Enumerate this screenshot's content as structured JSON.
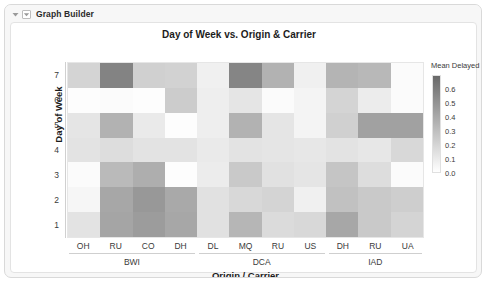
{
  "window": {
    "titlebar_label": "Graph Builder",
    "outer_disclosure_icon": "triangle-down-icon",
    "inner_disclosure_icon": "triangle-down-boxed-icon"
  },
  "chart_data": {
    "type": "heatmap",
    "title": "Day of Week vs. Origin & Carrier",
    "xlabel": "Origin / Carrier",
    "ylabel": "Day of Week",
    "legend_title": "Mean Delayed",
    "legend_position": "right",
    "grid": false,
    "zlim": [
      0.0,
      0.7
    ],
    "legend_ticks": [
      "0.6",
      "0.5",
      "0.4",
      "0.3",
      "0.2",
      "0.1",
      "0.0"
    ],
    "legend_tick_values": [
      0.6,
      0.5,
      0.4,
      0.3,
      0.2,
      0.1,
      0.0
    ],
    "colorscale": {
      "low_color": "#ffffff",
      "high_color": "#6e6e6e"
    },
    "x_categories": [
      "OH",
      "RU",
      "CO",
      "DH",
      "DL",
      "MQ",
      "RU",
      "US",
      "DH",
      "RU",
      "UA"
    ],
    "x_groups": [
      {
        "label": "BWI",
        "span": 4
      },
      {
        "label": "DCA",
        "span": 4
      },
      {
        "label": "IAD",
        "span": 3
      }
    ],
    "y_categories": [
      "7",
      "6",
      "5",
      "4",
      "3",
      "2",
      "1"
    ],
    "y_tick_labels_top_to_bottom": [
      "7",
      "6",
      "5",
      "4",
      "3",
      "2",
      "1"
    ],
    "values": [
      [
        0.2,
        0.58,
        0.22,
        0.21,
        0.07,
        0.57,
        0.36,
        0.07,
        0.35,
        0.33,
        0.02
      ],
      [
        0.01,
        0.02,
        0.01,
        0.24,
        0.08,
        0.12,
        0.02,
        0.05,
        0.2,
        0.09,
        0.02
      ],
      [
        0.12,
        0.36,
        0.1,
        0.01,
        0.08,
        0.36,
        0.12,
        0.05,
        0.22,
        0.44,
        0.44
      ],
      [
        0.13,
        0.16,
        0.13,
        0.13,
        0.1,
        0.13,
        0.12,
        0.11,
        0.13,
        0.11,
        0.18
      ],
      [
        0.02,
        0.32,
        0.38,
        0.01,
        0.09,
        0.25,
        0.14,
        0.12,
        0.27,
        0.16,
        0.02
      ],
      [
        0.04,
        0.41,
        0.48,
        0.4,
        0.14,
        0.18,
        0.2,
        0.07,
        0.29,
        0.25,
        0.23
      ],
      [
        0.13,
        0.42,
        0.46,
        0.41,
        0.14,
        0.34,
        0.17,
        0.18,
        0.41,
        0.25,
        0.2
      ]
    ]
  }
}
